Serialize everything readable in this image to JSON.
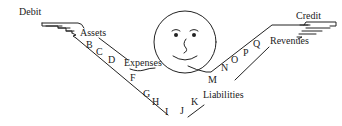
{
  "diagram": {
    "type": "debit-credit-mnemonic-figure",
    "left_side": {
      "hand_label": "Debit",
      "categories": [
        "Assets",
        "Expenses"
      ]
    },
    "right_side": {
      "hand_label": "Credit",
      "categories": [
        "Revenues",
        "Liabilities"
      ]
    },
    "letters": {
      "B": "B",
      "C": "C",
      "D": "D",
      "F": "F",
      "G": "G",
      "H": "H",
      "I": "I",
      "J": "J",
      "K": "K",
      "M": "M",
      "N": "N",
      "O": "O",
      "P": "P",
      "Q": "Q"
    },
    "face": "smiling-face",
    "line_color": "#222222",
    "background": "#ffffff"
  }
}
